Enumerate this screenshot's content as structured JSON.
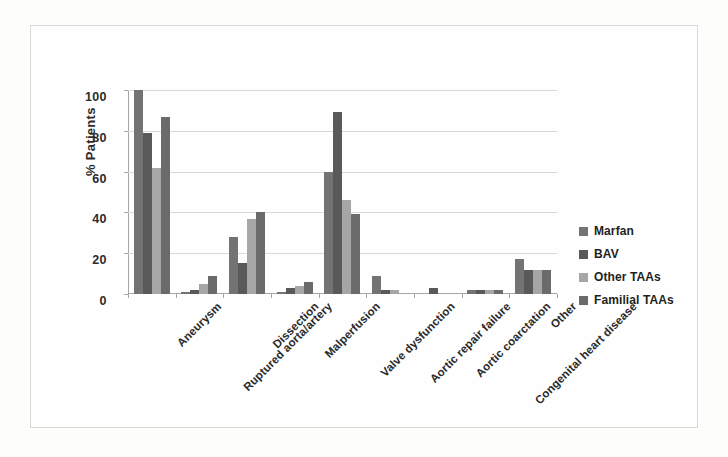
{
  "chart_data": {
    "type": "bar",
    "title": "",
    "subtitle": "",
    "xlabel": "",
    "ylabel": "% Patients",
    "ylim": [
      0,
      100
    ],
    "yticks": [
      0,
      20,
      40,
      60,
      80,
      100
    ],
    "grid": true,
    "legend_position": "right",
    "categories": [
      "Aneurysm",
      "Ruptured aorta/artery",
      "Dissection",
      "Malperfusion",
      "Valve dysfunction",
      "Aortic repair failure",
      "Aortic coarctation",
      "Congenital heart disease",
      "Other"
    ],
    "series": [
      {
        "name": "Marfan",
        "color": "#737373",
        "values": [
          100,
          1,
          28,
          1,
          60,
          9,
          0,
          2,
          17
        ]
      },
      {
        "name": "BAV",
        "color": "#595959",
        "values": [
          79,
          2,
          15,
          3,
          89,
          2,
          3,
          2,
          12
        ]
      },
      {
        "name": "Other TAAs",
        "color": "#a6a6a6",
        "values": [
          62,
          5,
          37,
          4,
          46,
          2,
          0,
          2,
          12
        ]
      },
      {
        "name": "Familial TAAs",
        "color": "#6b6b6b",
        "values": [
          87,
          9,
          40,
          6,
          39,
          0,
          0,
          2,
          12
        ]
      }
    ]
  },
  "legend": {
    "items": [
      {
        "label": "Marfan"
      },
      {
        "label": "BAV"
      },
      {
        "label": "Other TAAs"
      },
      {
        "label": "Familial TAAs"
      }
    ]
  },
  "axis": {
    "y_title": "% Patients",
    "y_ticks": [
      "0",
      "20",
      "40",
      "60",
      "80",
      "100"
    ]
  }
}
